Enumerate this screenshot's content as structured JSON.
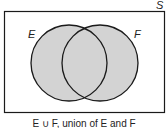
{
  "diagram": {
    "type": "venn",
    "universe_label": "S",
    "sets": [
      {
        "name": "E",
        "label": "E"
      },
      {
        "name": "F",
        "label": "F"
      }
    ],
    "shaded_region": "E ∪ F",
    "fill_color": "#d3d3d3",
    "stroke_color": "#1a1a1a",
    "caption": "E ∪ F, union of E and F"
  }
}
